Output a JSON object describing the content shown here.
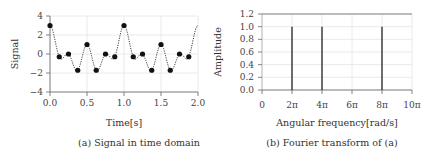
{
  "chart_data": [
    {
      "type": "line",
      "title": "",
      "caption": "(a)   Signal in time domain",
      "xlabel": "Time[s]",
      "ylabel": "Signal",
      "xlim": [
        0.0,
        2.0
      ],
      "ylim": [
        -4,
        4
      ],
      "xticks": [
        "0.0",
        "0.5",
        "1.0",
        "1.5",
        "2.0"
      ],
      "yticks": [
        "4",
        "2",
        "0",
        "−2",
        "−4"
      ],
      "grid": true,
      "series": [
        {
          "name": "sampled signal",
          "style": "dotted line with filled circle markers",
          "x": [
            0.0,
            0.125,
            0.25,
            0.375,
            0.5,
            0.625,
            0.75,
            0.875,
            1.0,
            1.125,
            1.25,
            1.375,
            1.5,
            1.625,
            1.75,
            1.875
          ],
          "y": [
            3.0,
            -0.29,
            0.0,
            -1.71,
            1.0,
            -1.71,
            0.0,
            -0.29,
            3.0,
            -0.29,
            0.0,
            -1.71,
            1.0,
            -1.71,
            0.0,
            -0.29
          ]
        }
      ],
      "continuous_function": "cos(2πt)+cos(4πt)+cos(8πt)"
    },
    {
      "type": "bar",
      "title": "",
      "caption": "(b)   Fourier transform of (a)",
      "xlabel": "Angular frequency[rad/s]",
      "ylabel": "Amplitude",
      "xlim": [
        0,
        10
      ],
      "ylim": [
        0.0,
        1.2
      ],
      "xticks": [
        "0",
        "2π",
        "4π",
        "6π",
        "8π",
        "10π"
      ],
      "yticks": [
        "1.2",
        "1.0",
        "0.8",
        "0.6",
        "0.4",
        "0.2",
        "0.0"
      ],
      "grid": true,
      "categories": [
        "2π",
        "4π",
        "8π"
      ],
      "values": [
        1.0,
        1.0,
        1.0
      ]
    }
  ]
}
